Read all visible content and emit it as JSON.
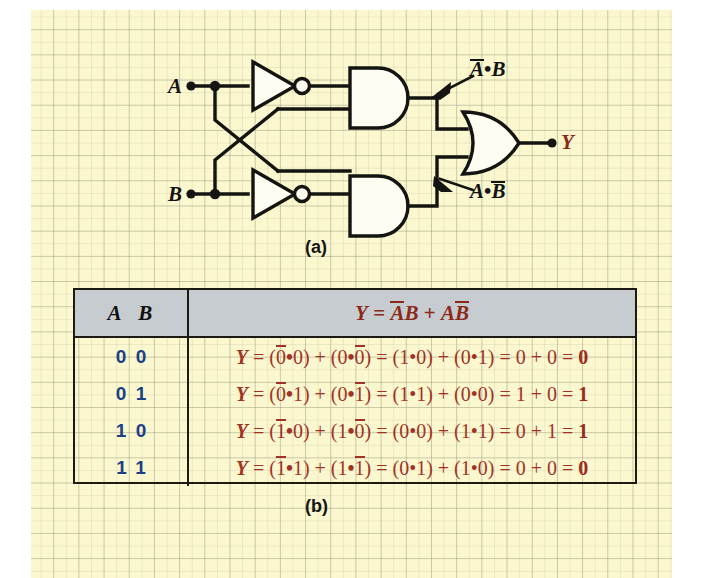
{
  "figure": {
    "part_a_caption": "(a)",
    "part_b_caption": "(b)"
  },
  "circuit": {
    "input_a_label": "A",
    "input_b_label": "B",
    "output_label": "Y",
    "annotation_top": {
      "term1": "A",
      "operator": "•",
      "term2": "B",
      "overbar_on": "A",
      "text": "Ā • B"
    },
    "annotation_bottom": {
      "term1": "A",
      "operator": "•",
      "term2": "B",
      "overbar_on": "B",
      "text": "A • B̄"
    },
    "gates": [
      {
        "type": "not-gate",
        "name": "inverter-a"
      },
      {
        "type": "not-gate",
        "name": "inverter-b"
      },
      {
        "type": "and-gate",
        "name": "and-gate-top"
      },
      {
        "type": "and-gate",
        "name": "and-gate-bottom"
      },
      {
        "type": "or-gate",
        "name": "or-gate-output"
      }
    ]
  },
  "table": {
    "header": {
      "col_a": "A",
      "col_b": "B",
      "formula_prefix": "Y",
      "formula_equals": "=",
      "formula_term1_a": "A",
      "formula_term1_b": "B",
      "formula_plus": "+",
      "formula_term2_a": "A",
      "formula_term2_b": "B",
      "formula_text": "Y = ĀB + AB̄"
    },
    "rows": [
      {
        "a": "0",
        "b": "0",
        "y": "Y",
        "eq1": "=",
        "t1_open": "(",
        "t1_l": "0",
        "t1_dot": "•",
        "t1_r": "0",
        "t1_close": ")",
        "plus1": "+",
        "t2_open": "(",
        "t2_l": "0",
        "t2_dot": "•",
        "t2_r": "0",
        "t2_close": ")",
        "eq2": "=",
        "t3": "(1•0)",
        "plus2": "+",
        "t4": "(0•1)",
        "eq3": "=",
        "s1": "0",
        "plus3": "+",
        "s2": "0",
        "eq4": "=",
        "result": "0",
        "full_text": "Y = (0̄•0) + (0•0̄) = (1•0) + (0•1) = 0 + 0 = 0"
      },
      {
        "a": "0",
        "b": "1",
        "y": "Y",
        "eq1": "=",
        "t1_open": "(",
        "t1_l": "0",
        "t1_dot": "•",
        "t1_r": "1",
        "t1_close": ")",
        "plus1": "+",
        "t2_open": "(",
        "t2_l": "0",
        "t2_dot": "•",
        "t2_r": "1",
        "t2_close": ")",
        "eq2": "=",
        "t3": "(1•1)",
        "plus2": "+",
        "t4": "(0•0)",
        "eq3": "=",
        "s1": "1",
        "plus3": "+",
        "s2": "0",
        "eq4": "=",
        "result": "1",
        "full_text": "Y = (0̄•1) + (0•1̄) = (1•1) + (0•0) = 1 + 0 = 1"
      },
      {
        "a": "1",
        "b": "0",
        "y": "Y",
        "eq1": "=",
        "t1_open": "(",
        "t1_l": "1",
        "t1_dot": "•",
        "t1_r": "0",
        "t1_close": ")",
        "plus1": "+",
        "t2_open": "(",
        "t2_l": "1",
        "t2_dot": "•",
        "t2_r": "0",
        "t2_close": ")",
        "eq2": "=",
        "t3": "(0•0)",
        "plus2": "+",
        "t4": "(1•1)",
        "eq3": "=",
        "s1": "0",
        "plus3": "+",
        "s2": "1",
        "eq4": "=",
        "result": "1",
        "full_text": "Y = (1̄•0) + (1•0̄) = (0•0) + (1•1) = 0 + 1 = 1"
      },
      {
        "a": "1",
        "b": "1",
        "y": "Y",
        "eq1": "=",
        "t1_open": "(",
        "t1_l": "1",
        "t1_dot": "•",
        "t1_r": "1",
        "t1_close": ")",
        "plus1": "+",
        "t2_open": "(",
        "t2_l": "1",
        "t2_dot": "•",
        "t2_r": "1",
        "t2_close": ")",
        "eq2": "=",
        "t3": "(0•1)",
        "plus2": "+",
        "t4": "(1•0)",
        "eq3": "=",
        "s1": "0",
        "plus3": "+",
        "s2": "0",
        "eq4": "=",
        "result": "0",
        "full_text": "Y = (1̄•1) + (1•1̄) = (0•1) + (1•0) = 0 + 0 = 0"
      }
    ]
  },
  "colors": {
    "paper": "#fbf8d0",
    "grid": "#96967855",
    "wire": "#141410",
    "expression_red": "#a23226",
    "binary_blue": "#1c3f86",
    "header_gray": "#c7ccd1",
    "output_label": "#8c2a18"
  }
}
